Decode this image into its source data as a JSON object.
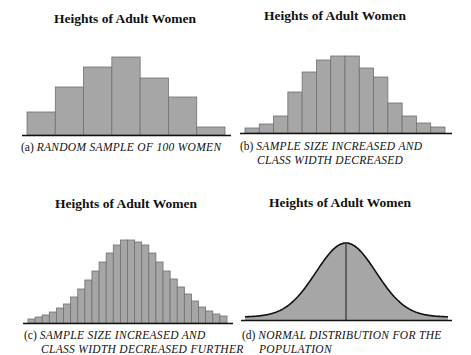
{
  "panels": [
    {
      "id": "a",
      "title": "Heights of Adult Women",
      "label": "(a)",
      "caption_line1": "RANDOM SAMPLE OF 100 WOMEN",
      "caption_line2": ""
    },
    {
      "id": "b",
      "title": "Heights of Adult Women",
      "label": "(b)",
      "caption_line1": "SAMPLE SIZE INCREASED AND",
      "caption_line2": "CLASS WIDTH DECREASED"
    },
    {
      "id": "c",
      "title": "Heights of Adult Women",
      "label": "(c)",
      "caption_line1": "SAMPLE SIZE INCREASED AND",
      "caption_line2": "CLASS WIDTH DECREASED FURTHER"
    },
    {
      "id": "d",
      "title": "Heights of Adult Women",
      "label": "(d)",
      "caption_line1": "NORMAL DISTRIBUTION FOR THE",
      "caption_line2": "POPULATION"
    }
  ],
  "colors": {
    "bar_fill": "#a6a6a6",
    "bar_edge": "#707070",
    "axis": "#111111",
    "curve": "#111111"
  },
  "chart_data": [
    {
      "type": "bar",
      "title": "Heights of Adult Women",
      "caption": "(a) RANDOM SAMPLE OF 100 WOMEN",
      "xlabel": "",
      "ylabel": "",
      "grid": false,
      "categories": [
        "1",
        "2",
        "3",
        "4",
        "5",
        "6",
        "7"
      ],
      "values": [
        23,
        48,
        68,
        78,
        57,
        38,
        8
      ],
      "note": "relative bar heights (px above baseline), no axis ticks shown"
    },
    {
      "type": "bar",
      "title": "Heights of Adult Women",
      "caption": "(b) SAMPLE SIZE INCREASED AND CLASS WIDTH DECREASED",
      "xlabel": "",
      "ylabel": "",
      "grid": false,
      "categories": [
        "1",
        "2",
        "3",
        "4",
        "5",
        "6",
        "7",
        "8",
        "9",
        "10",
        "11",
        "12",
        "13",
        "14"
      ],
      "values": [
        5,
        9,
        17,
        41,
        61,
        73,
        77,
        77,
        65,
        56,
        30,
        17,
        10,
        6
      ],
      "note": "relative bar heights (px above baseline), no axis ticks shown"
    },
    {
      "type": "bar",
      "title": "Heights of Adult Women",
      "caption": "(c) SAMPLE SIZE INCREASED AND CLASS WIDTH DECREASED FURTHER",
      "xlabel": "",
      "ylabel": "",
      "grid": false,
      "categories": [
        "1",
        "2",
        "3",
        "4",
        "5",
        "6",
        "7",
        "8",
        "9",
        "10",
        "11",
        "12",
        "13",
        "14",
        "15",
        "16",
        "17",
        "18",
        "19",
        "20",
        "21",
        "22",
        "23",
        "24",
        "25",
        "26",
        "27",
        "28"
      ],
      "values": [
        4,
        6,
        8,
        11,
        15,
        19,
        26,
        34,
        43,
        52,
        61,
        70,
        78,
        83,
        83,
        81,
        78,
        70,
        61,
        52,
        44,
        36,
        29,
        22,
        16,
        12,
        9,
        7
      ],
      "note": "relative bar heights (px above baseline), no axis ticks shown"
    },
    {
      "type": "area",
      "title": "Heights of Adult Women",
      "caption": "(d) NORMAL DISTRIBUTION FOR THE POPULATION",
      "xlabel": "",
      "ylabel": "",
      "grid": false,
      "distribution": "normal",
      "mean_marker": true,
      "peak_height": 77,
      "note": "bell curve, shaded, vertical line at the mean"
    }
  ]
}
